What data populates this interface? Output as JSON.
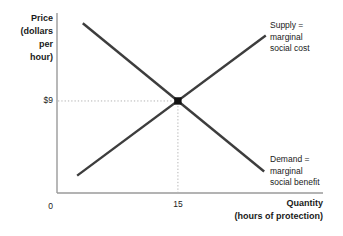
{
  "figure": {
    "background": "#ffffff",
    "curve_color": "#3d3d3d",
    "axis_color": "#9a9a9a",
    "guide_color": "#b3b3b3",
    "marker_color": "#111111",
    "text_color": "#1a1a1a"
  },
  "chart_data": {
    "type": "line",
    "title": "",
    "xlabel": "Quantity (hours of protection)",
    "ylabel": "Price (dollars per hour)",
    "xlabel_display": [
      "Quantity",
      "(hours of protection)"
    ],
    "ylabel_display": [
      "Price",
      "(dollars",
      "per",
      "hour)"
    ],
    "xlim": [
      0,
      33
    ],
    "ylim": [
      0,
      17.6
    ],
    "grid": false,
    "legend": "none",
    "origin_label": "0",
    "x_ticks": [
      {
        "value": 15,
        "label": "15"
      }
    ],
    "y_ticks": [
      {
        "value": 9,
        "label": "$9"
      }
    ],
    "series": [
      {
        "name": "Supply",
        "role": "supply",
        "points": [
          [
            2.5,
            1.7
          ],
          [
            25.9,
            15.4
          ]
        ]
      },
      {
        "name": "Demand",
        "role": "demand",
        "points": [
          [
            3.2,
            16.6
          ],
          [
            25.7,
            2.1
          ]
        ]
      }
    ],
    "equilibrium": {
      "quantity": 15,
      "price": 9,
      "marker": "filled-square"
    },
    "guides": {
      "style": "dotted",
      "horizontal_to_y_axis": true,
      "vertical_to_x_axis": true
    },
    "annotations": [
      {
        "target": "supply",
        "lines": [
          "Supply =",
          "marginal",
          "social cost"
        ]
      },
      {
        "target": "demand",
        "lines": [
          "Demand =",
          "marginal",
          "social benefit"
        ]
      }
    ]
  }
}
